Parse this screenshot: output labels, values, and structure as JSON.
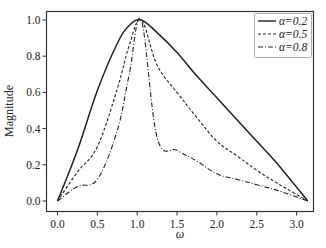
{
  "chart_data": {
    "type": "line",
    "title": "",
    "xlabel": "ω",
    "ylabel": "Magnitude",
    "xlim": [
      -0.13,
      3.3
    ],
    "ylim": [
      -0.05,
      1.05
    ],
    "xticks": [
      0.0,
      0.5,
      1.0,
      1.5,
      2.0,
      2.5,
      3.0
    ],
    "xtick_labels": [
      "0.0",
      "0.5",
      "1.0",
      "1.5",
      "2.0",
      "2.5",
      "3.0"
    ],
    "yticks": [
      0.0,
      0.2,
      0.4,
      0.6,
      0.8,
      1.0
    ],
    "ytick_labels": [
      "0.0",
      "0.2",
      "0.4",
      "0.6",
      "0.8",
      "1.0"
    ],
    "grid": false,
    "legend_position": "upper right",
    "x": [
      0.0,
      0.25,
      0.5,
      0.75,
      0.9,
      1.05,
      1.25,
      1.5,
      1.75,
      2.0,
      2.25,
      2.5,
      2.75,
      3.14
    ],
    "series": [
      {
        "name": "α=0.2",
        "style": "solid",
        "values": [
          0.0,
          0.28,
          0.61,
          0.87,
          0.97,
          1.0,
          0.93,
          0.82,
          0.69,
          0.57,
          0.45,
          0.33,
          0.21,
          0.0
        ]
      },
      {
        "name": "α=0.5",
        "style": "dashed",
        "values": [
          0.0,
          0.16,
          0.3,
          0.62,
          0.86,
          1.0,
          0.75,
          0.6,
          0.46,
          0.33,
          0.25,
          0.17,
          0.1,
          0.0
        ]
      },
      {
        "name": "α=0.8",
        "style": "dashdot",
        "values": [
          0.0,
          0.08,
          0.12,
          0.39,
          0.7,
          1.0,
          0.35,
          0.28,
          0.22,
          0.15,
          0.12,
          0.09,
          0.06,
          0.0
        ]
      }
    ]
  },
  "legend": {
    "items": [
      {
        "label": "α=0.2"
      },
      {
        "label": "α=0.5"
      },
      {
        "label": "α=0.8"
      }
    ]
  },
  "axes": {
    "xlabel": "ω",
    "ylabel": "Magnitude"
  }
}
